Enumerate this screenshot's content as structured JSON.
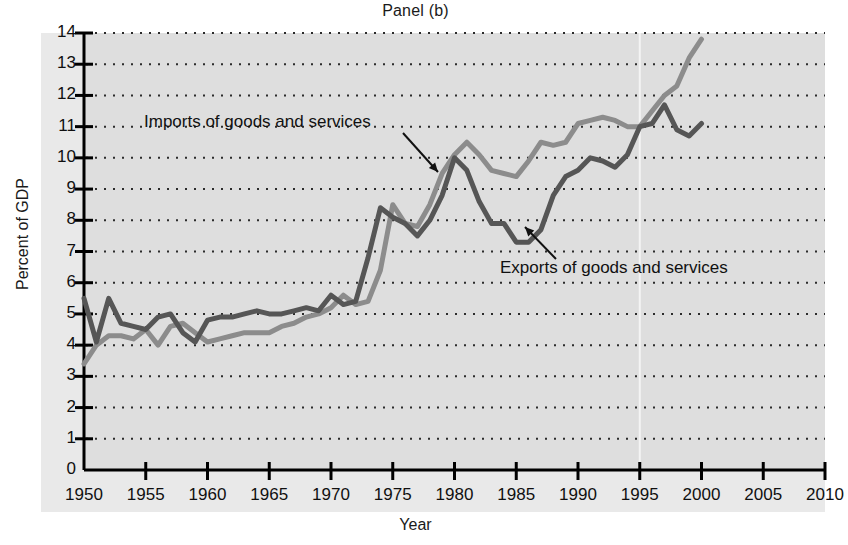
{
  "figure": {
    "title": "Panel (b)",
    "xlabel": "Year",
    "ylabel": "Percent of GDP"
  },
  "annotations": {
    "imports_label": "Imports of goods and services",
    "exports_label": "Exports of goods and services"
  },
  "colors": {
    "imports_line": "#8c8c8c",
    "exports_line": "#565656",
    "plot_background": "#dedede",
    "label_band": "#e9e9e9",
    "axis": "#000000",
    "gridline": "#2b2b2b"
  },
  "axes": {
    "y_ticks": [
      "0",
      "1",
      "2",
      "3",
      "4",
      "5",
      "6",
      "7",
      "8",
      "9",
      "10",
      "11",
      "12",
      "13",
      "14"
    ],
    "x_ticks": [
      "1950",
      "1955",
      "1960",
      "1965",
      "1970",
      "1975",
      "1980",
      "1985",
      "1990",
      "1995",
      "2000",
      "2005",
      "2010"
    ]
  },
  "chart_data": {
    "type": "line",
    "title": "Panel (b)",
    "xlabel": "Year",
    "ylabel": "Percent of GDP",
    "xlim": [
      1950,
      2010
    ],
    "ylim": [
      0,
      14
    ],
    "grid": true,
    "legend": "annotated inline (no legend box)",
    "x": [
      1950,
      1951,
      1952,
      1953,
      1954,
      1955,
      1956,
      1957,
      1958,
      1959,
      1960,
      1961,
      1962,
      1963,
      1964,
      1965,
      1966,
      1967,
      1968,
      1969,
      1970,
      1971,
      1972,
      1973,
      1974,
      1975,
      1976,
      1977,
      1978,
      1979,
      1980,
      1981,
      1982,
      1983,
      1984,
      1985,
      1986,
      1987,
      1988,
      1989,
      1990,
      1991,
      1992,
      1993,
      1994,
      1995,
      1996,
      1997,
      1998,
      1999,
      2000
    ],
    "series": [
      {
        "name": "Exports of goods and services",
        "color": "#565656",
        "values": [
          5.5,
          4.1,
          5.5,
          4.7,
          4.6,
          4.5,
          4.9,
          5.0,
          4.4,
          4.1,
          4.8,
          4.9,
          4.9,
          5.0,
          5.1,
          5.0,
          5.0,
          5.1,
          5.2,
          5.1,
          5.6,
          5.3,
          5.4,
          6.8,
          8.4,
          8.1,
          7.9,
          7.5,
          8.0,
          8.8,
          10.0,
          9.6,
          8.6,
          7.9,
          7.9,
          7.3,
          7.3,
          7.7,
          8.8,
          9.4,
          9.6,
          10.0,
          9.9,
          9.7,
          10.1,
          11.0,
          11.1,
          11.7,
          10.9,
          10.7,
          11.1
        ]
      },
      {
        "name": "Imports of goods and services",
        "color": "#8c8c8c",
        "values": [
          3.4,
          4.0,
          4.3,
          4.3,
          4.2,
          4.5,
          4.0,
          4.6,
          4.7,
          4.4,
          4.1,
          4.2,
          4.3,
          4.4,
          4.4,
          4.4,
          4.6,
          4.7,
          4.9,
          5.0,
          5.2,
          5.6,
          5.3,
          5.4,
          6.4,
          8.5,
          7.9,
          7.8,
          8.5,
          9.5,
          10.1,
          10.5,
          10.1,
          9.6,
          9.5,
          9.4,
          9.9,
          10.5,
          10.4,
          10.5,
          11.1,
          11.2,
          11.3,
          11.2,
          11.0,
          11.0,
          11.5,
          12.0,
          12.3,
          13.2,
          13.8
        ]
      }
    ]
  }
}
